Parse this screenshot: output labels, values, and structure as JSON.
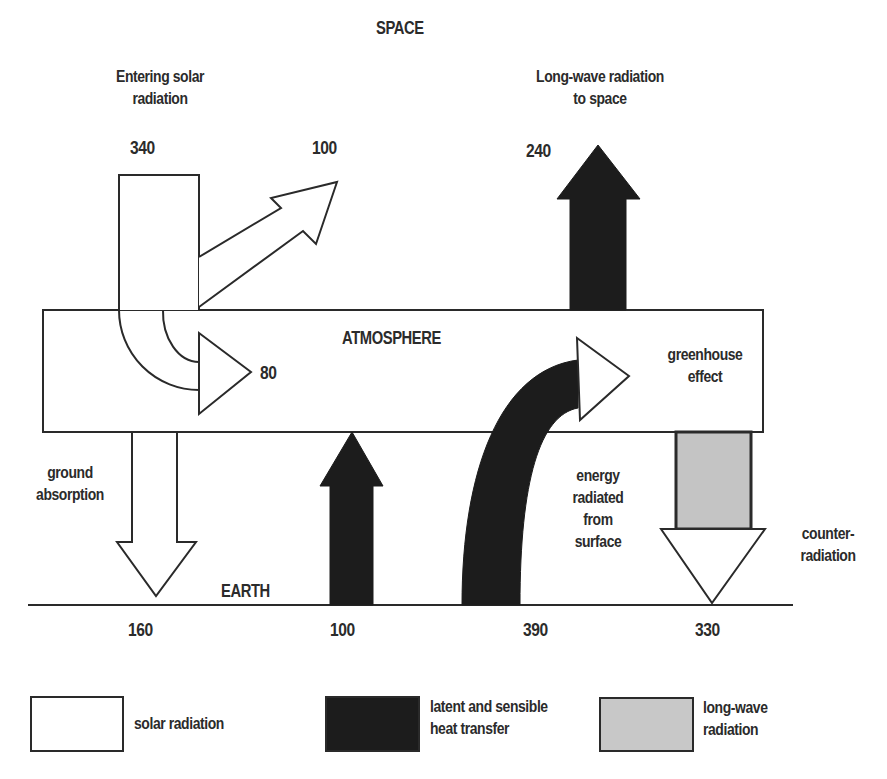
{
  "diagram": {
    "title_top": "SPACE",
    "atmosphere_label": "ATMOSPHERE",
    "earth_label": "EARTH",
    "flows": {
      "entering_solar": {
        "label_line1": "Entering solar",
        "label_line2": "radiation",
        "value": "340"
      },
      "reflected_to_space": {
        "value": "100"
      },
      "absorbed_by_atmosphere": {
        "value": "80"
      },
      "longwave_to_space": {
        "label_line1": "Long-wave radiation",
        "label_line2": "to space",
        "value": "240"
      },
      "greenhouse": {
        "label_line1": "greenhouse",
        "label_line2": "effect"
      },
      "ground_absorption": {
        "label_line1": "ground",
        "label_line2": "absorption",
        "value": "160"
      },
      "heat_transfer": {
        "value": "100"
      },
      "surface_radiation": {
        "label_line1": "energy",
        "label_line2": "radiated",
        "label_line3": "from",
        "label_line4": "surface",
        "value": "390"
      },
      "counter_radiation": {
        "label_line1": "counter-",
        "label_line2": "radiation",
        "value": "330"
      }
    },
    "legend": [
      {
        "label_line1": "solar radiation",
        "label_line2": "",
        "color": "#ffffff"
      },
      {
        "label_line1": "latent and sensible",
        "label_line2": "heat transfer",
        "color": "#1c1c1c"
      },
      {
        "label_line1": "long-wave",
        "label_line2": "radiation",
        "color": "#c8c8c8"
      }
    ],
    "colors": {
      "stroke": "#2a2a2a",
      "dark_fill": "#1c1c1c",
      "grey_fill": "#c4c4c4",
      "background": "#ffffff"
    }
  }
}
